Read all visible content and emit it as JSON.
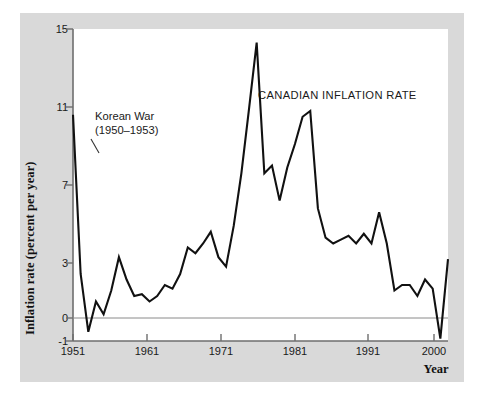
{
  "figure": {
    "background_color": "#ffffff",
    "panel_color": "#d9d9d9",
    "plot_background": "#ffffff",
    "line_color": "#111111",
    "axis_color": "#6e6e6e"
  },
  "chart_data": {
    "type": "line",
    "title": "CANADIAN INFLATION RATE",
    "xlabel": "Year",
    "ylabel": "Inflation rate (percent per year)",
    "grid": false,
    "legend": null,
    "zero_line": 0,
    "xlim": [
      1951,
      2000
    ],
    "ylim": [
      -1,
      15
    ],
    "xticks": [
      1951,
      1961,
      1971,
      1981,
      1991,
      2000
    ],
    "xtick_labels": [
      "1951",
      "1961",
      "1971",
      "1981",
      "1991",
      "2000"
    ],
    "yticks": [
      -1,
      0,
      3,
      7,
      11,
      15
    ],
    "ytick_labels": [
      "-1",
      "0",
      "3",
      "7",
      "11",
      "15"
    ],
    "series_name": "Canadian inflation rate",
    "x": [
      1951,
      1952,
      1953,
      1954,
      1955,
      1956,
      1957,
      1958,
      1959,
      1960,
      1961,
      1962,
      1963,
      1964,
      1965,
      1966,
      1967,
      1968,
      1969,
      1970,
      1971,
      1972,
      1973,
      1974,
      1975,
      1976,
      1977,
      1978,
      1979,
      1980,
      1981,
      1982,
      1983,
      1984,
      1985,
      1986,
      1987,
      1988,
      1989,
      1990,
      1991,
      1992,
      1993,
      1994,
      1995,
      1996,
      1997,
      1998,
      1999,
      2000
    ],
    "values": [
      10.6,
      2.4,
      -0.6,
      0.9,
      0.2,
      1.5,
      3.3,
      2.1,
      1.2,
      1.3,
      0.9,
      1.2,
      1.8,
      1.6,
      2.4,
      3.8,
      3.5,
      4.0,
      4.6,
      3.3,
      2.8,
      4.9,
      7.6,
      10.9,
      14.3,
      7.6,
      8.0,
      6.2,
      7.9,
      9.1,
      10.5,
      10.8,
      5.8,
      4.3,
      4.0,
      4.2,
      4.4,
      4.0,
      4.5,
      4.0,
      5.6,
      4.0,
      1.5,
      1.8,
      1.8,
      1.2,
      2.1,
      1.6,
      -0.9,
      3.2
    ],
    "annotations": [
      {
        "name": "korean-war",
        "text_line1": "Korean War",
        "text_line2": "(1950–1953)",
        "points_to_year": 1952
      }
    ]
  },
  "axis": {
    "y_title": "Inflation rate (percent per year)",
    "x_title": "Year"
  }
}
